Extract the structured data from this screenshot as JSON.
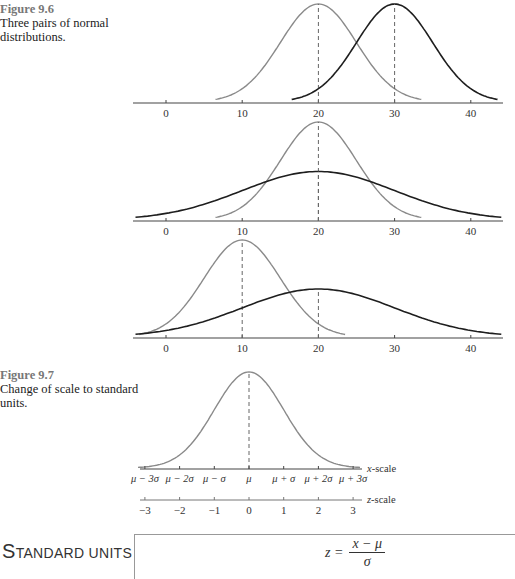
{
  "figure_9_6": {
    "label": "Figure 9.6",
    "caption": "Three pairs of normal distributions."
  },
  "figure_9_7": {
    "label": "Figure 9.7",
    "caption": "Change of scale to standard units."
  },
  "section": {
    "title_first": "S",
    "title_rest": "tandard units"
  },
  "formula": {
    "lhs": "z =",
    "numerator": "x − μ",
    "denominator": "σ"
  },
  "colors": {
    "light_curve": "#8a8a8a",
    "dark_curve": "#1e1e1e",
    "axis": "#444444",
    "caption_label": "#777777"
  },
  "chart_data": [
    {
      "type": "line",
      "title": "Figure 9.6 panel 1",
      "x_ticks": [
        0,
        10,
        20,
        30,
        40
      ],
      "series": [
        {
          "name": "light",
          "mean": 20,
          "sd": 5,
          "color": "#8a8a8a"
        },
        {
          "name": "dark",
          "mean": 30,
          "sd": 5,
          "color": "#1e1e1e"
        }
      ],
      "xlim": [
        -4,
        44
      ]
    },
    {
      "type": "line",
      "title": "Figure 9.6 panel 2",
      "x_ticks": [
        0,
        10,
        20,
        30,
        40
      ],
      "series": [
        {
          "name": "light",
          "mean": 20,
          "sd": 5,
          "color": "#8a8a8a"
        },
        {
          "name": "dark",
          "mean": 20,
          "sd": 10,
          "color": "#1e1e1e"
        }
      ],
      "xlim": [
        -4,
        44
      ]
    },
    {
      "type": "line",
      "title": "Figure 9.6 panel 3",
      "x_ticks": [
        0,
        10,
        20,
        30,
        40
      ],
      "series": [
        {
          "name": "light",
          "mean": 10,
          "sd": 5,
          "color": "#8a8a8a"
        },
        {
          "name": "dark",
          "mean": 20,
          "sd": 10,
          "color": "#1e1e1e"
        }
      ],
      "xlim": [
        -4,
        44
      ]
    },
    {
      "type": "line",
      "title": "Figure 9.7",
      "x_scale_label": "x-scale",
      "z_scale_label": "z-scale",
      "x_scale_ticks": [
        "μ − 3σ",
        "μ − 2σ",
        "μ − σ",
        "μ",
        "μ + σ",
        "μ + 2σ",
        "μ + 3σ"
      ],
      "z_scale_ticks": [
        "−3",
        "−2",
        "−1",
        "0",
        "1",
        "2",
        "3"
      ],
      "series": [
        {
          "name": "standard normal",
          "mean": 0,
          "sd": 1,
          "color": "#8a8a8a"
        }
      ]
    }
  ]
}
